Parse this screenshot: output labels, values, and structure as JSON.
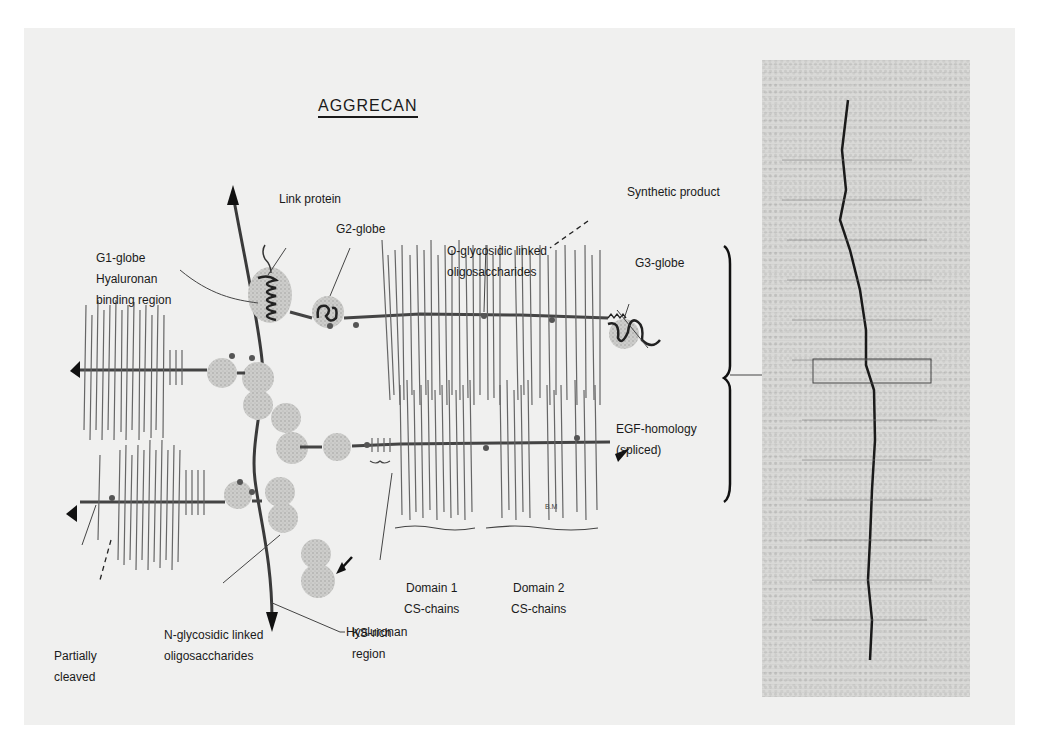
{
  "figure": {
    "title": "AGGRECAN",
    "background_color": "#f0f0ef",
    "line_color": "#555555",
    "ink_color": "#1a1a1a",
    "globe_color": "#c8c8c6"
  },
  "labels": {
    "g1_globe": [
      "G1-globe",
      "Hyaluronan",
      "binding region"
    ],
    "link_protein": "Link protein",
    "g2_globe": "G2-globe",
    "o_glycosidic": [
      "O-glycosidic linked",
      "oligosaccharides"
    ],
    "synthetic_product": "Synthetic product",
    "g3_globe": "G3-globe",
    "egf_homology": [
      "EGF-homology",
      "(spliced)"
    ],
    "domain1": [
      "Domain 1",
      "CS-chains"
    ],
    "domain2": [
      "Domain 2",
      "CS-chains"
    ],
    "ks_rich": [
      "KS-rich",
      "region"
    ],
    "n_glycosidic": [
      "N-glycosidic linked",
      "oligosaccharides"
    ],
    "partially_cleaved": [
      "Partially",
      "cleaved"
    ],
    "hyaluronan": "Hyaluronan",
    "artist_initials": "B.M"
  },
  "micrograph": {
    "description": "Electron micrograph of aggrecan molecule with highlighted region box"
  }
}
